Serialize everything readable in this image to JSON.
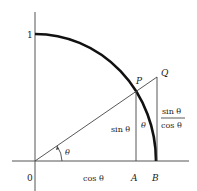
{
  "diagram": {
    "labels": {
      "one": "1",
      "origin": "0",
      "P": "P",
      "Q": "Q",
      "A": "A",
      "B": "B",
      "theta_angle": "θ",
      "theta_arc": "θ",
      "sin": "sin θ",
      "cos": "cos θ",
      "tan_num": "sin θ",
      "tan_den": "cos θ"
    },
    "colors": {
      "line": "#333333",
      "arc": "#111111",
      "text": "#222222"
    }
  }
}
